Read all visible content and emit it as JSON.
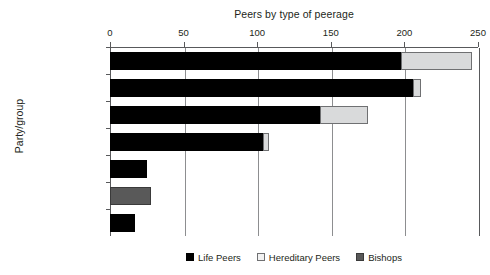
{
  "chart_data": {
    "type": "bar",
    "orientation": "horizontal",
    "stacked": true,
    "title": "Peers by type of peerage",
    "xlabel": "",
    "ylabel": "Party/group",
    "xlim": [
      0,
      250
    ],
    "xticks": [
      0,
      50,
      100,
      150,
      200,
      250
    ],
    "grid": "vertical",
    "legend_position": "bottom",
    "categories": [
      "Conservative",
      "Labour",
      "Crossbench",
      "Liberal Democrat",
      "Non-Affiliated",
      "Bishops",
      "Other Parties"
    ],
    "series": [
      {
        "name": "Life Peers",
        "color": "#000000",
        "values": [
          198,
          206,
          143,
          104,
          25,
          0,
          17
        ]
      },
      {
        "name": "Hereditary Peers",
        "color": "#d9dadb",
        "values": [
          48,
          5,
          32,
          4,
          0,
          0,
          0
        ]
      },
      {
        "name": "Bishops",
        "color": "#595959",
        "values": [
          0,
          0,
          0,
          0,
          0,
          28,
          0
        ]
      }
    ],
    "totals": [
      246,
      211,
      175,
      108,
      25,
      28,
      17
    ]
  },
  "legend": {
    "items": [
      {
        "label": "Life Peers",
        "swatch": "life"
      },
      {
        "label": "Hereditary Peers",
        "swatch": "hered"
      },
      {
        "label": "Bishops",
        "swatch": "bish"
      }
    ]
  }
}
